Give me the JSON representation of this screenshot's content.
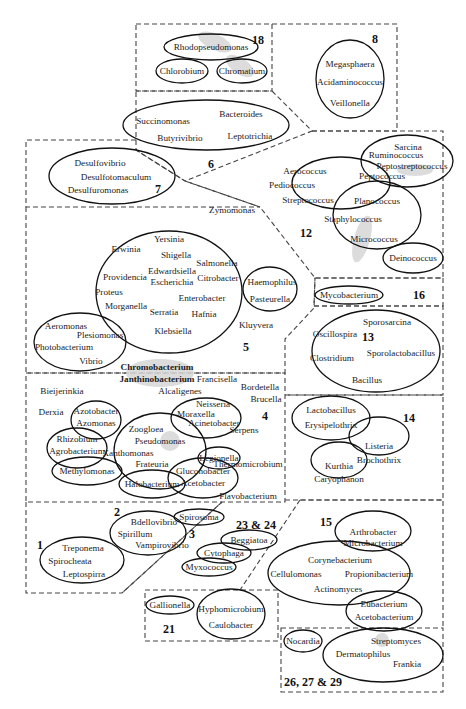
{
  "diagram": {
    "type": "bacterial-genera-grouping",
    "groups": {
      "g18": {
        "number": "18",
        "genera": [
          "Rhodopseudomonas",
          "Chlorobium",
          "Chromatium"
        ]
      },
      "g8": {
        "number": "8",
        "genera": [
          "Megasphaera",
          "Acidaminococcus",
          "Veillonella"
        ]
      },
      "g6": {
        "number": "6",
        "genera": [
          "Succinomonas",
          "Bacteroides",
          "Butyrivibrio",
          "Leptotrichia"
        ]
      },
      "g7": {
        "number": "7",
        "genera": [
          "Desulfovibrio",
          "Desulfotomaculum",
          "Desulfuromonas"
        ]
      },
      "g12": {
        "number": "12",
        "genera": [
          "Sarcina",
          "Ruminococcus",
          "Peptostreptococcus",
          "Peptococcus",
          "Aerococcus",
          "Pediococcus",
          "Streptococcus",
          "Planococcus",
          "Staphylococcus",
          "Micrococcus",
          "Deinococcus"
        ]
      },
      "g5": {
        "number": "5",
        "genera": [
          "Zymomonas",
          "Yersinia",
          "Erwinia",
          "Shigella",
          "Salmonella",
          "Providencia",
          "Edwardsiella",
          "Escherichia",
          "Citrobacter",
          "Proteus",
          "Enterobacter",
          "Morganella",
          "Serratia",
          "Hafnia",
          "Klebsiella",
          "Haemophilus",
          "Pasteurella",
          "Kluyvera",
          "Aeromonas",
          "Plesiomonas",
          "Photobacterium",
          "Vibrio"
        ]
      },
      "g16": {
        "number": "16",
        "genera": [
          "Mycobacterium"
        ]
      },
      "g13": {
        "number": "13",
        "genera": [
          "Sporosarcina",
          "Oscillospira",
          "Sporolactobacillus",
          "Clostridium",
          "Bacillus"
        ]
      },
      "g4": {
        "number": "4",
        "genera": [
          "Chromobacterium",
          "Janthinobacterium",
          "Francisella",
          "Bordetella",
          "Bieijerinkia",
          "Alcaligenes",
          "Brucella",
          "Derxia",
          "Azotobacter",
          "Azomonas",
          "Neisseria",
          "Moraxella",
          "Acinetobacter",
          "Serpens",
          "Zoogloea",
          "Rhizobium",
          "Agrobacterium",
          "Pseudomonas",
          "Xanthomonas",
          "Legionella",
          "Frateuria",
          "Thermomicrobium",
          "Methylomonas",
          "Gluconobacter",
          "Acetobacter",
          "Halobacterium",
          "Flavobacterium"
        ]
      },
      "g14": {
        "number": "14",
        "genera": [
          "Lactobacillus",
          "Erysipelothrix",
          "Listeria",
          "Brochothrix",
          "Kurthia",
          "Caryophanon"
        ]
      },
      "g1": {
        "number": "1",
        "genera": [
          "Treponema",
          "Spirocheata",
          "Leptospirra"
        ]
      },
      "g2": {
        "number": "2",
        "genera": [
          "Bdellovibrio",
          "Spirillum",
          "Vampirovibrio"
        ]
      },
      "g3": {
        "number": "3",
        "genera": [
          "Spirosoma"
        ]
      },
      "g23_24": {
        "number": "23 & 24",
        "genera": [
          "Beggiatoa",
          "Cytophaga",
          "Myxococcus"
        ]
      },
      "g15": {
        "number": "15",
        "genera": [
          "Arthrobacter",
          "Microbacterium",
          "Corynebacterium",
          "Cellulomonas",
          "Propionibacterium",
          "Actinomyces",
          "Eubacterium",
          "Acetobacterium"
        ]
      },
      "g21": {
        "number": "21",
        "genera": [
          "Gallionella",
          "Hyphomicrobium",
          "Caulobacter"
        ]
      },
      "g26_27_29": {
        "number": "26, 27 & 29",
        "genera": [
          "Nocardia",
          "Streptomyces",
          "Dermatophilus",
          "Frankia"
        ]
      }
    }
  }
}
